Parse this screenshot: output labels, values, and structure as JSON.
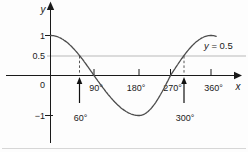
{
  "figure": {
    "y_axis_label": "y",
    "x_axis_label": "x",
    "origin_label": "0",
    "y_ticks": [
      {
        "label": "1",
        "value": 1
      },
      {
        "label": "0.5",
        "value": 0.5
      },
      {
        "label": "−1",
        "value": -1
      }
    ],
    "x_ticks": [
      {
        "label": "90°",
        "value": 90
      },
      {
        "label": "180°",
        "value": 180
      },
      {
        "label": "270°",
        "value": 270
      },
      {
        "label": "360°",
        "value": 360
      }
    ],
    "reference_line": {
      "label_var": "y",
      "label_rest": " = 0.5",
      "value": 0.5
    },
    "solution_markers": [
      {
        "label": "60°",
        "value": 60
      },
      {
        "label": "300°",
        "value": 300
      }
    ]
  },
  "chart_data": {
    "type": "line",
    "function": "y = cos x",
    "x_unit": "degrees",
    "x_range": [
      0,
      372
    ],
    "ylim": [
      -1.4,
      1.75
    ],
    "xlabel": "x",
    "ylabel": "y",
    "x_tick_values": [
      90,
      180,
      270,
      360
    ],
    "y_tick_values": [
      1,
      -1
    ],
    "y_label_values": [
      1,
      0.5,
      -1
    ],
    "key_points": [
      {
        "x": 0,
        "y": 1
      },
      {
        "x": 60,
        "y": 0.5
      },
      {
        "x": 90,
        "y": 0
      },
      {
        "x": 180,
        "y": -1
      },
      {
        "x": 270,
        "y": 0
      },
      {
        "x": 300,
        "y": 0.5
      },
      {
        "x": 360,
        "y": 1
      }
    ],
    "reference_line": {
      "y": 0.5,
      "label": "y = 0.5"
    },
    "highlighted_x": [
      60,
      300
    ],
    "grid": false,
    "legend": false,
    "colors": {
      "curve": "#4d4d4d",
      "axis": "#1a1a1a",
      "reference_line": "#b9b9b9",
      "dashed_guide": "#555555",
      "text": "#1a1a1a",
      "background": "#fdfdfd"
    }
  }
}
